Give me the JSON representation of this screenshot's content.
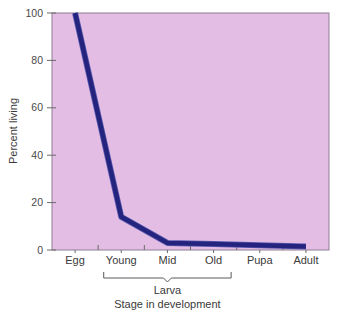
{
  "chart_data": {
    "type": "line",
    "title": "",
    "subtitle": "",
    "xlabel": "Stage in development",
    "ylabel": "Percent living",
    "categories": [
      "Egg",
      "Young",
      "Mid",
      "Old",
      "Pupa",
      "Adult"
    ],
    "series": [
      {
        "name": "Percent living",
        "values": [
          100,
          14,
          3,
          2.5,
          2,
          1.5
        ]
      }
    ],
    "ylim": [
      0,
      100
    ],
    "yticks": [
      0,
      20,
      40,
      60,
      80,
      100
    ],
    "ytick_labels": [
      "0",
      "20",
      "40",
      "60",
      "80",
      "100"
    ],
    "grid": false,
    "legend": "none",
    "annotations": [
      {
        "text": "Larva",
        "type": "bracket-group",
        "spans": [
          "Young",
          "Mid",
          "Old"
        ]
      }
    ],
    "colors": {
      "line": "#24247e",
      "line_highlight": "#5b5bb0",
      "plot_background": "#e3bde3",
      "plot_border": "#8d7f92",
      "axis_text": "#3a3a3a",
      "tick_text": "#4a4a4a",
      "figure_background": "#ffffff"
    }
  },
  "axis": {
    "y_label": "Percent living",
    "x_label": "Stage in development",
    "y_ticks": [
      "100",
      "80",
      "60",
      "40",
      "20",
      "0"
    ],
    "x_categories": [
      "Egg",
      "Young",
      "Mid",
      "Old",
      "Pupa",
      "Adult"
    ],
    "group_bracket_label": "Larva"
  }
}
